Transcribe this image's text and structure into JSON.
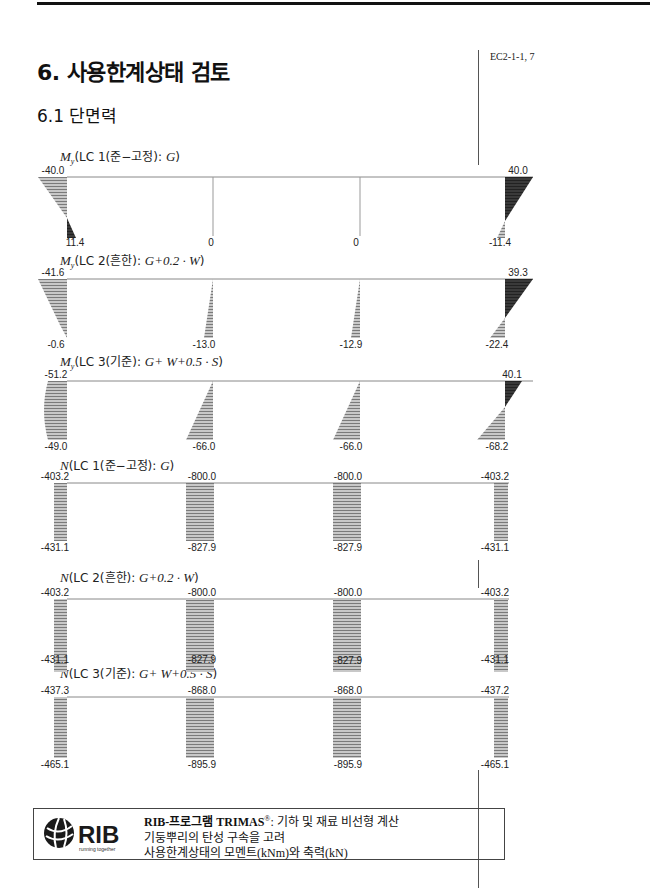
{
  "header": {
    "page_title": "6. 사용한계상태 검토",
    "section_title": "6.1 단면력",
    "margin_reference": "EC2-1-1, 7"
  },
  "diagrams": [
    {
      "id": "my-lc1",
      "symbol": "M",
      "subscript": "y",
      "title_text": "(LC 1(준−고정): ",
      "formula": "G",
      "close": ")",
      "type": "moment",
      "top_values": [
        "-40.0",
        "",
        "",
        "40.0"
      ],
      "bottom_values": [
        "11.4",
        "0",
        "0",
        "-11.4"
      ]
    },
    {
      "id": "my-lc2",
      "symbol": "M",
      "subscript": "y",
      "title_text": "(LC 2(흔한): ",
      "formula": "G+0.2 · W",
      "close": ")",
      "type": "moment",
      "top_values": [
        "-41.6",
        "",
        "",
        "39.3"
      ],
      "bottom_values": [
        "-0.6",
        "-13.0",
        "-12.9",
        "-22.4"
      ]
    },
    {
      "id": "my-lc3",
      "symbol": "M",
      "subscript": "y",
      "title_text": "(LC 3(기준): ",
      "formula": "G+ W+0.5 · S",
      "close": ")",
      "type": "moment",
      "top_values": [
        "-51.2",
        "",
        "",
        "40.1"
      ],
      "bottom_values": [
        "-49.0",
        "-66.0",
        "-66.0",
        "-68.2"
      ]
    },
    {
      "id": "n-lc1",
      "symbol": "N",
      "subscript": "",
      "title_text": "(LC 1(준−고정): ",
      "formula": "G",
      "close": ")",
      "type": "axial",
      "top_values": [
        "-403.2",
        "-800.0",
        "-800.0",
        "-403.2"
      ],
      "bottom_values": [
        "-431.1",
        "-827.9",
        "-827.9",
        "-431.1"
      ]
    },
    {
      "id": "n-lc2",
      "symbol": "N",
      "subscript": "",
      "title_text": "(LC 2(흔한): ",
      "formula": "G+0.2 · W",
      "close": ")",
      "type": "axial",
      "top_values": [
        "-403.2",
        "-800.0",
        "-800.0",
        "-403.2"
      ],
      "bottom_values": [
        "-431.1",
        "-827.9",
        "-827.9",
        "-431.1"
      ]
    },
    {
      "id": "n-lc3",
      "symbol": "N",
      "subscript": "",
      "title_text": "(LC 3(기준): ",
      "formula": "G+ W+0.5 · S",
      "close": ")",
      "type": "axial",
      "top_values": [
        "-437.3",
        "-868.0",
        "-868.0",
        "-437.2"
      ],
      "bottom_values": [
        "-465.1",
        "-895.9",
        "-895.9",
        "-465.1"
      ]
    }
  ],
  "footer": {
    "logo_text": "RIB",
    "logo_tagline": "running together",
    "line1_bold": "RIB-프로그램 TRIMAS",
    "line1_reg": "®",
    "line1_rest": ": 기하 및 재료 비선형 계산",
    "line2": "기둥뿌리의 탄성 구속을 고려",
    "line3": "사용한계상태의 모멘트(kNm)와 축력(kN)"
  },
  "colors": {
    "hatch_light": "#9a9a9a",
    "hatch_dark": "#333333",
    "line": "#777777"
  }
}
